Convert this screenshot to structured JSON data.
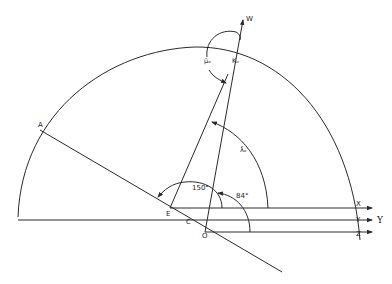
{
  "diagram": {
    "type": "geometric-angle-diagram",
    "points": {
      "A": "A",
      "E": "E",
      "C": "C",
      "O": "O",
      "W": "W",
      "X": "X",
      "Y": "Y",
      "Z": "Z",
      "Y_ref": "Υ"
    },
    "angles": {
      "angle_150": "150°",
      "angle_84": "84°",
      "mu": "μ̄ₒ",
      "lambda": "λ̄ₒ",
      "kappa": "Kₒ"
    },
    "colors": {
      "line": "#2a2a2a",
      "background": "#ffffff"
    }
  }
}
